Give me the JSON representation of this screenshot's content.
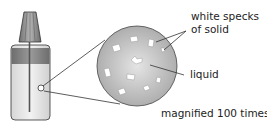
{
  "diagram": {
    "labels": {
      "specks_line1": "white specks",
      "specks_line2": "of solid",
      "liquid": "liquid",
      "magnification": "magnified 100 times"
    },
    "colors": {
      "circle_fill": "#c9c9c9",
      "speck_fill": "#ffffff",
      "cap_fill": "#8c8c8c",
      "bottle_band": "#8a8a8a",
      "liquid_fill": "#e6e6e6",
      "line": "#333333"
    }
  }
}
